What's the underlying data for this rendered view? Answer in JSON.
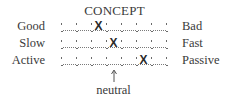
{
  "title": "CONCEPT",
  "scale_points": 7,
  "rows": [
    {
      "left": "Good",
      "right": "Bad",
      "rating": 3
    },
    {
      "left": "Slow",
      "right": "Fast",
      "rating": 4
    },
    {
      "left": "Active",
      "right": "Passive",
      "rating": 6
    }
  ],
  "mark_symbol": "X",
  "neutral_label": "neutral",
  "neutral_point": 4,
  "arrow_icon": "up-arrow"
}
